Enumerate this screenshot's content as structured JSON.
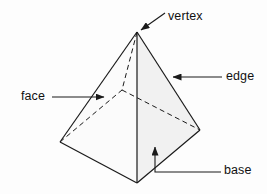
{
  "figure": {
    "shape_name": "pyramid",
    "background_color": "#fdfdfd",
    "stroke_color": "#1a1a1a",
    "face_fill_left": "#fbfbfb",
    "face_fill_right": "#f2f2f2",
    "face_fill_base": "#f7f7f7"
  },
  "labels": {
    "vertex": "vertex",
    "edge": "edge",
    "face": "face",
    "base": "base"
  },
  "geometry": {
    "apex": {
      "x": 137,
      "y": 32
    },
    "base_front": {
      "x": 137,
      "y": 183
    },
    "base_left": {
      "x": 60,
      "y": 142
    },
    "base_right": {
      "x": 200,
      "y": 130
    },
    "base_back_hidden": {
      "x": 122,
      "y": 90
    }
  },
  "callouts": [
    {
      "name": "vertex",
      "text": "vertex",
      "leader": "diagonal",
      "arrow_tip": {
        "x": 139,
        "y": 31
      },
      "leader_start": {
        "x": 165,
        "y": 13
      }
    },
    {
      "name": "edge",
      "text": "edge",
      "leader": "horizontal",
      "arrow_tip": {
        "x": 171,
        "y": 77
      },
      "leader_start": {
        "x": 222,
        "y": 77
      }
    },
    {
      "name": "face",
      "text": "face",
      "leader": "horizontal",
      "arrow_tip": {
        "x": 105,
        "y": 97
      },
      "leader_start": {
        "x": 52,
        "y": 97
      }
    },
    {
      "name": "base",
      "text": "base",
      "leader": "elbow",
      "arrow_tip": {
        "x": 155,
        "y": 145
      },
      "leader_start": {
        "x": 221,
        "y": 172
      }
    }
  ]
}
